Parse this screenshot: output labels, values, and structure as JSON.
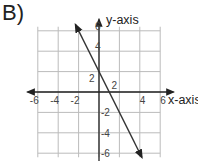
{
  "problem_label": "B)",
  "chart_data": {
    "type": "line",
    "title": "",
    "xlabel": "x-axis",
    "ylabel": "y-axis",
    "xlim": [
      -6,
      6
    ],
    "ylim": [
      -6,
      6
    ],
    "x_ticks": [
      "-6",
      "-4",
      "-2",
      "4",
      "6"
    ],
    "y_ticks": [
      "6",
      "4",
      "2",
      "-2",
      "-4",
      "-6"
    ],
    "extra_tick_labels": {
      "x_2": "2",
      "y_2": "2"
    },
    "grid": true,
    "grid_step": 2,
    "series": [
      {
        "name": "line",
        "equation": "y = -2x + 2",
        "slope": -2,
        "intercept": 2,
        "points": [
          {
            "x": -2.3,
            "y": 6.6
          },
          {
            "x": 0,
            "y": 2
          },
          {
            "x": 1,
            "y": 0
          },
          {
            "x": 4.2,
            "y": -6.4
          }
        ],
        "arrows_both_ends": true
      }
    ]
  }
}
